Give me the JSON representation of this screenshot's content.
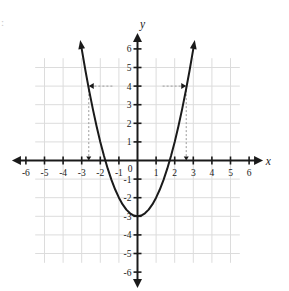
{
  "figure": {
    "kind": "coordinate-plane-graph",
    "background_color": "#ffffff",
    "grid_color": "#dcdcdc",
    "axis_color": "#1a1a1a",
    "curve_color": "#1a1a1a",
    "dash_color": "#9a9a9a",
    "corner_artifact": ":"
  },
  "axes": {
    "x_axis_label": "x",
    "y_axis_label": "y",
    "x_tick_labels": [
      "-6",
      "-5",
      "-4",
      "-3",
      "-2",
      "-1",
      "1",
      "2",
      "3",
      "4",
      "5",
      "6"
    ],
    "y_tick_labels": [
      "6",
      "5",
      "4",
      "3",
      "2",
      "1",
      "-1",
      "-2",
      "-3",
      "-4",
      "-5",
      "-6"
    ],
    "origin_label": "0"
  },
  "chart_data": {
    "type": "line",
    "title": "",
    "xlabel": "x",
    "ylabel": "y",
    "xlim": [
      -6.6,
      6.6
    ],
    "ylim": [
      -6.6,
      6.6
    ],
    "xticks": [
      -6,
      -5,
      -4,
      -3,
      -2,
      -1,
      1,
      2,
      3,
      4,
      5,
      6
    ],
    "yticks": [
      6,
      5,
      4,
      3,
      2,
      1,
      -1,
      -2,
      -3,
      -4,
      -5,
      -6
    ],
    "grid": true,
    "grid_range": [
      -5.5,
      5.5
    ],
    "legend": null,
    "series": [
      {
        "name": "parabola",
        "equation": "y = x^2 - 3",
        "vertex": [
          0,
          -3
        ],
        "x_intercepts": [
          -1.732,
          1.732
        ],
        "y_intercept": -3,
        "x": [
          -3.0,
          -2.8,
          -2.6,
          -2.4,
          -2.2,
          -2.0,
          -1.8,
          -1.6,
          -1.4,
          -1.2,
          -1.0,
          -0.8,
          -0.6,
          -0.4,
          -0.2,
          0.0,
          0.2,
          0.4,
          0.6,
          0.8,
          1.0,
          1.2,
          1.4,
          1.6,
          1.8,
          2.0,
          2.2,
          2.4,
          2.6,
          2.8,
          3.0
        ],
        "y": [
          6.0,
          4.84,
          3.76,
          2.76,
          1.84,
          1.0,
          0.24,
          -0.44,
          -1.04,
          -1.56,
          -2.0,
          -2.36,
          -2.64,
          -2.84,
          -2.96,
          -3.0,
          -2.96,
          -2.84,
          -2.64,
          -2.36,
          -2.0,
          -1.56,
          -1.04,
          -0.44,
          0.24,
          1.0,
          1.84,
          2.76,
          3.76,
          4.84,
          6.0
        ],
        "arrow_ends": [
          "left-top",
          "right-top"
        ]
      }
    ],
    "annotations": [
      {
        "kind": "horizontal-arrow",
        "y": 4,
        "from_x": -1.35,
        "to_x": -2.62,
        "direction": "left",
        "style": "dashed"
      },
      {
        "kind": "horizontal-arrow",
        "y": 4,
        "from_x": 1.35,
        "to_x": 2.62,
        "direction": "right",
        "style": "dashed"
      },
      {
        "kind": "vertical-drop",
        "x": -2.62,
        "from_y": 4,
        "to_y": 0,
        "style": "dashed"
      },
      {
        "kind": "vertical-drop",
        "x": 2.62,
        "from_y": 4,
        "to_y": 0,
        "style": "dashed"
      }
    ]
  }
}
